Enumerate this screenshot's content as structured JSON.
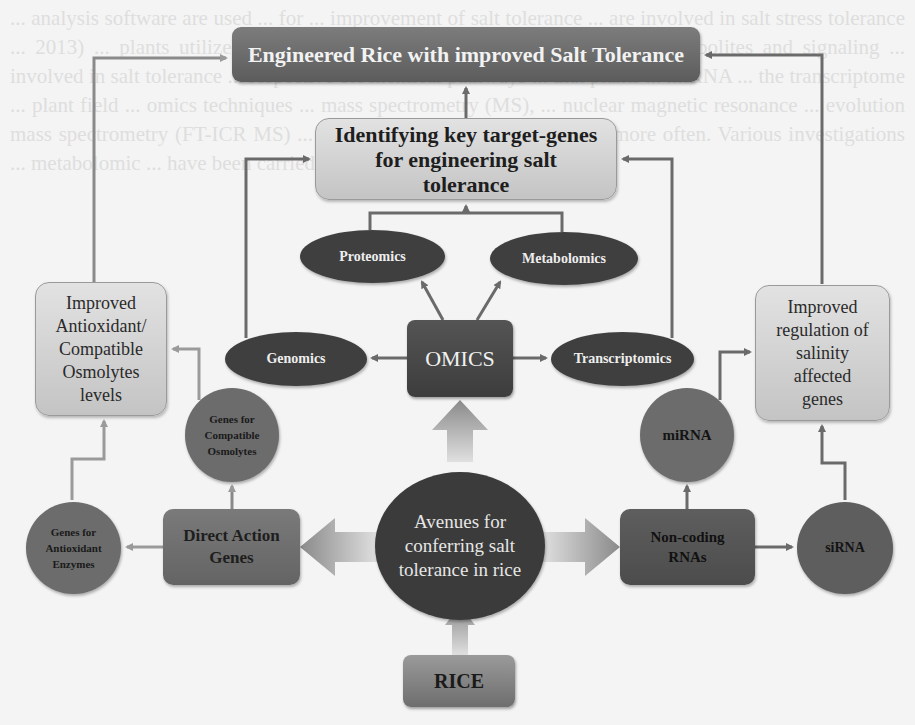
{
  "background_text": "... analysis software are used ... for ... improvement of salt tolerance ... are involved in salt stress tolerance ... 2013) ... plants utilize a variety of metabolites as well as secondary metabolites and signaling ... involved in salt tolerance ... respective biochemical pathways ... that plants ... miRNA ... the transcriptome ... plant field ... omics techniques ... mass spectrometry (MS), ... nuclear magnetic resonance ... evolution mass spectrometry (FT-ICR MS) ... NMR and LC-MS are being used more often. Various investigations ... metabolomic ... have been carried",
  "diagram": {
    "title_node": "Engineered Rice with improved Salt Tolerance",
    "identify_node": "Identifying key target-genes for engineering salt tolerance",
    "omics_node": "OMICS",
    "omics_branches": {
      "proteomics": "Proteomics",
      "metabolomics": "Metabolomics",
      "genomics": "Genomics",
      "transcriptomics": "Transcriptomics"
    },
    "left_outcome": "Improved Antioxidant/ Compatible Osmolytes levels",
    "right_outcome": "Improved regulation of salinity affected genes",
    "compatible_osmolytes": "Genes for Compatible Osmolytes",
    "antioxidant_enzymes": "Genes for Antioxidant Enzymes",
    "direct_action": "Direct Action Genes",
    "avenues": "Avenues for conferring salt tolerance in rice",
    "noncoding": "Non-coding RNAs",
    "mirna": "miRNA",
    "sirna": "siRNA",
    "rice": "RICE"
  },
  "colors": {
    "dark_node": "#3f3f3f",
    "mid_node": "#6c6c6c",
    "light_node": "#d2d2d2",
    "connector": "#6a6a6a",
    "background": "#f4f4f4"
  }
}
